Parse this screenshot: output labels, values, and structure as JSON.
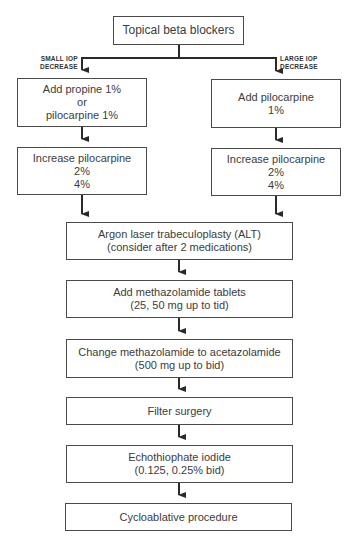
{
  "diagram": {
    "type": "flowchart",
    "nodes": {
      "start": {
        "lines": [
          "Topical beta blockers"
        ]
      },
      "left1": {
        "lines": [
          "Add propine 1%",
          "or",
          "pilocarpine 1%"
        ]
      },
      "right1": {
        "lines": [
          "Add pilocarpine",
          "1%"
        ]
      },
      "left2": {
        "lines": [
          "Increase pilocarpine",
          "2%",
          "4%"
        ]
      },
      "right2": {
        "lines": [
          "Increase pilocarpine",
          "2%",
          "4%"
        ]
      },
      "alt": {
        "lines": [
          "Argon laser trabeculoplasty (ALT)",
          "(consider after 2 medications)"
        ]
      },
      "methazolamide": {
        "lines": [
          "Add methazolamide tablets",
          "(25, 50 mg up to tid)"
        ]
      },
      "acetazolamide": {
        "lines": [
          "Change methazolamide to acetazolamide",
          "(500 mg up to bid)"
        ]
      },
      "filter": {
        "lines": [
          "Filter surgery"
        ]
      },
      "echothiophate": {
        "lines": [
          "Echothiophate iodide",
          "(0.125, 0.25% bid)"
        ]
      },
      "cyclo": {
        "lines": [
          "Cycloablative procedure"
        ]
      }
    },
    "branch_labels": {
      "left": [
        "SMALL IOP",
        "DECREASE"
      ],
      "right": [
        "LARGE IOP",
        "DECREASE"
      ]
    },
    "edges": [
      [
        "start",
        "left1"
      ],
      [
        "start",
        "right1"
      ],
      [
        "left1",
        "left2"
      ],
      [
        "right1",
        "right2"
      ],
      [
        "left2",
        "alt"
      ],
      [
        "right2",
        "alt"
      ],
      [
        "alt",
        "methazolamide"
      ],
      [
        "methazolamide",
        "acetazolamide"
      ],
      [
        "acetazolamide",
        "filter"
      ],
      [
        "filter",
        "echothiophate"
      ],
      [
        "echothiophate",
        "cyclo"
      ]
    ],
    "colors": {
      "line": "#2a2a2a",
      "border": "#4a4a4a",
      "text": "#3c3c3c",
      "background": "#ffffff"
    }
  }
}
